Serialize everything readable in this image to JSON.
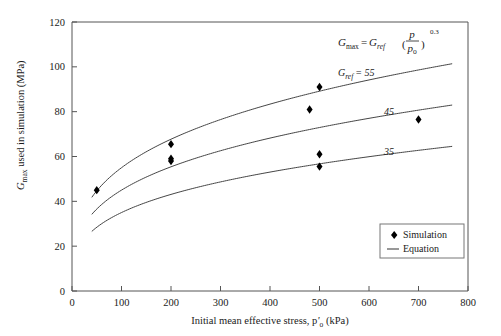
{
  "chart_data": {
    "type": "scatter",
    "title": "",
    "xlabel": "Initial mean effective stress, p'o (kPa)",
    "ylabel": "Gmax used in simulation (MPa)",
    "xlim": [
      0,
      800
    ],
    "ylim": [
      0,
      120
    ],
    "xticks": [
      0,
      100,
      200,
      300,
      400,
      500,
      600,
      700,
      800
    ],
    "yticks": [
      0,
      20,
      40,
      60,
      80,
      100,
      120
    ],
    "grid": false,
    "legend_position": "bottom-right-inside",
    "annotation_equation": "Gmax = Gref (p/po)^0.3",
    "equation_exponent": "0.3",
    "series": [
      {
        "name": "Simulation",
        "type": "scatter",
        "marker": "diamond",
        "color": "#000000",
        "points": [
          {
            "x": 50,
            "y": 45.0
          },
          {
            "x": 200,
            "y": 65.5
          },
          {
            "x": 200,
            "y": 59.0
          },
          {
            "x": 200,
            "y": 58.0
          },
          {
            "x": 480,
            "y": 81.0
          },
          {
            "x": 500,
            "y": 91.0
          },
          {
            "x": 500,
            "y": 61.0
          },
          {
            "x": 500,
            "y": 55.5
          },
          {
            "x": 700,
            "y": 76.5
          }
        ]
      },
      {
        "name": "Equation",
        "type": "line",
        "color": "#444444",
        "curves": [
          {
            "label": "55",
            "gref": 55,
            "exponent": 0.3,
            "pref": 100,
            "xstart": 40,
            "xend": 770
          },
          {
            "label": "45",
            "gref": 45,
            "exponent": 0.3,
            "pref": 100,
            "xstart": 40,
            "xend": 770
          },
          {
            "label": "35",
            "gref": 35,
            "exponent": 0.3,
            "pref": 100,
            "xstart": 40,
            "xend": 770
          }
        ]
      }
    ]
  },
  "axis": {
    "y": {
      "label_main": "G",
      "label_sub": "max",
      "label_rest": " used in simulation (MPa)",
      "ticks": [
        "0",
        "20",
        "40",
        "60",
        "80",
        "100",
        "120"
      ]
    },
    "x": {
      "label_lead": "Initial mean effective stress, p",
      "label_prime": "'",
      "label_sub": "o",
      "label_tail": " (kPa)",
      "ticks": [
        "0",
        "100",
        "200",
        "300",
        "400",
        "500",
        "600",
        "700",
        "800"
      ]
    }
  },
  "equation": {
    "g_main": "G",
    "g_sub": "max",
    "equals": "=",
    "gref_main": "G",
    "gref_sub": "ref",
    "paren_open": "(",
    "numerator": "p",
    "denominator_main": "p",
    "denominator_sub": "o",
    "paren_close": ")",
    "exponent": "0.3"
  },
  "curve_labels": {
    "first_prefix_main": "G",
    "first_prefix_sub": "ref",
    "first_equals": "= 55",
    "second": "45",
    "third": "35"
  },
  "legend": {
    "items": [
      {
        "label": "Simulation",
        "marker": "diamond"
      },
      {
        "label": "Equation",
        "marker": "line"
      }
    ]
  }
}
